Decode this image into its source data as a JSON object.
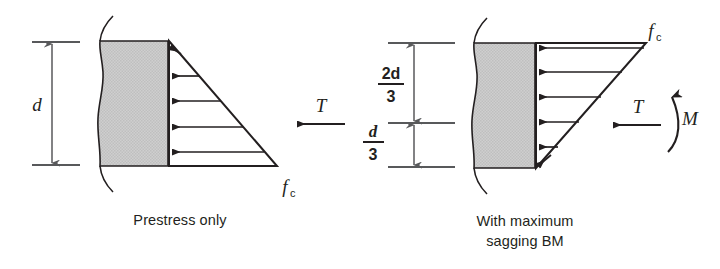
{
  "figure": {
    "type": "engineering-stress-diagram",
    "background_color": "#ffffff",
    "line_color": "#231f20",
    "dimension_line_color": "#58595b",
    "shade_color": "#c8c8c8"
  },
  "panels": [
    {
      "id": "prestress-only",
      "caption": "Prestress only",
      "caption_lines": [
        "Prestress only"
      ],
      "dimension_labels": [
        {
          "id": "d",
          "text": "d",
          "style": "italic",
          "position": "left"
        }
      ],
      "stress_labels": [
        {
          "id": "fc",
          "symbol": "f",
          "subscript": "c",
          "position": "bottom-right"
        }
      ],
      "force_labels": [
        {
          "id": "T",
          "text": "T",
          "style": "italic",
          "arrow": "left",
          "position": "right-middle"
        }
      ],
      "moment_labels": [],
      "stress_block": {
        "shape": "triangle",
        "apex": "top-left",
        "max_at": "bottom",
        "arrow_count": 5,
        "arrow_direction": "left"
      }
    },
    {
      "id": "with-maximum-sagging-bm",
      "caption": "With maximum sagging BM",
      "caption_lines": [
        "With maximum",
        "sagging BM"
      ],
      "dimension_labels": [
        {
          "id": "two-d-over-three",
          "numerator": "2d",
          "denominator": "3",
          "style": "fraction",
          "position": "left-upper"
        },
        {
          "id": "d-over-three",
          "numerator": "d",
          "denominator": "3",
          "style": "fraction",
          "position": "left-lower"
        }
      ],
      "stress_labels": [
        {
          "id": "fc",
          "symbol": "f",
          "subscript": "c",
          "position": "top-right"
        }
      ],
      "force_labels": [
        {
          "id": "T",
          "text": "T",
          "style": "italic",
          "arrow": "left",
          "position": "right-middle"
        }
      ],
      "moment_labels": [
        {
          "id": "M",
          "text": "M",
          "style": "italic",
          "arrow": "curved-up",
          "position": "far-right"
        }
      ],
      "stress_block": {
        "shape": "triangle",
        "apex": "bottom-left",
        "max_at": "top",
        "arrow_count": 5,
        "arrow_direction": "left"
      }
    }
  ]
}
